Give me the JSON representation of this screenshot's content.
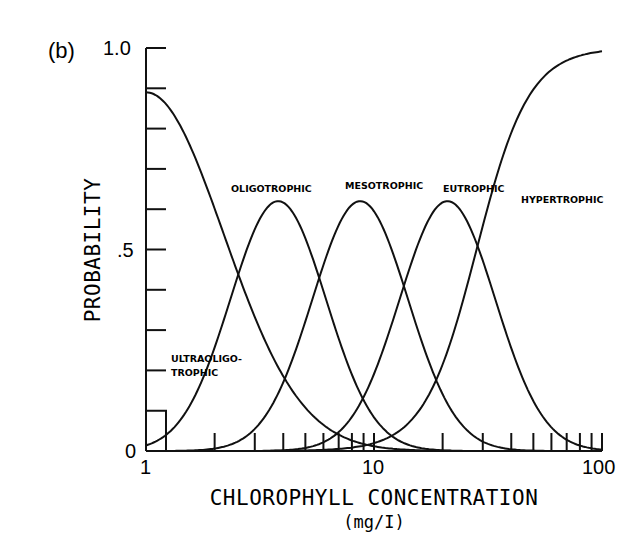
{
  "panel_label": "(b)",
  "chart_data": {
    "type": "line",
    "title": "",
    "xlabel": "CHLOROPHYLL CONCENTRATION",
    "xunit": "(mg/I)",
    "ylabel": "PROBABILITY",
    "xscale": "log",
    "xlim": [
      1,
      100
    ],
    "ylim": [
      0,
      1.0
    ],
    "x_tick_labels": [
      "1",
      "10",
      "100"
    ],
    "y_tick_labels": [
      "0",
      ".5",
      "1.0"
    ],
    "y_minor_ticks": [
      0.1,
      0.2,
      0.3,
      0.4,
      0.6,
      0.7,
      0.8,
      0.9
    ],
    "grid": false,
    "legend": "inline curve labels",
    "series": [
      {
        "name": "ULTRAOLIGOTROPHIC",
        "label_line1": "ULTRAOLIGO-",
        "label_line2": "TROPHIC",
        "x": [
          1,
          1.5,
          2,
          3,
          5,
          8,
          15,
          30
        ],
        "values": [
          0.89,
          0.68,
          0.48,
          0.25,
          0.09,
          0.03,
          0.01,
          0.0
        ]
      },
      {
        "name": "OLIGOTROPHIC",
        "label": "OLIGOTROPHIC",
        "x": [
          1,
          1.5,
          2,
          3,
          3.8,
          5,
          8,
          15,
          30
        ],
        "values": [
          0.14,
          0.32,
          0.45,
          0.6,
          0.62,
          0.58,
          0.36,
          0.1,
          0.01
        ]
      },
      {
        "name": "MESOTROPHIC",
        "label": "MESOTROPHIC",
        "x": [
          1,
          2,
          3,
          5,
          8.7,
          12,
          20,
          40,
          100
        ],
        "values": [
          0.0,
          0.04,
          0.13,
          0.38,
          0.62,
          0.56,
          0.32,
          0.07,
          0.0
        ]
      },
      {
        "name": "EUTROPHIC",
        "label": "EUTROPHIC",
        "x": [
          1,
          3,
          5,
          10,
          21,
          30,
          50,
          100
        ],
        "values": [
          0.0,
          0.01,
          0.05,
          0.24,
          0.62,
          0.55,
          0.31,
          0.06
        ]
      },
      {
        "name": "HYPERTROPHIC",
        "label": "HYPERTROPHIC",
        "x": [
          1,
          5,
          10,
          20,
          28,
          40,
          60,
          100
        ],
        "values": [
          0.0,
          0.01,
          0.05,
          0.3,
          0.5,
          0.78,
          0.92,
          0.99
        ]
      }
    ]
  },
  "style": {
    "line_color": "#111111",
    "background": "#ffffff"
  }
}
